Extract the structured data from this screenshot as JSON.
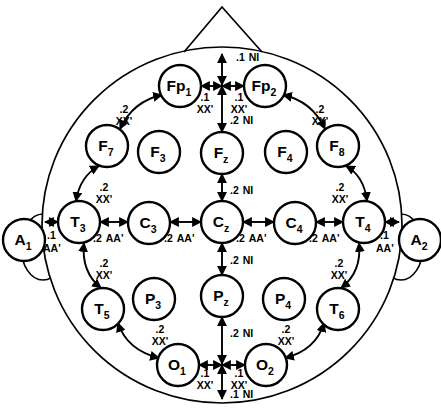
{
  "figure": {
    "head_outline": {
      "cx": 222,
      "cy": 225,
      "rx": 180,
      "ry": 178
    },
    "nose": {
      "apex_x": 222,
      "apex_y": 7,
      "left_x": 184,
      "left_y": 52,
      "right_x": 262,
      "right_y": 52
    },
    "ears": [
      {
        "name": "left-ear",
        "cx": 43,
        "cy": 247,
        "rx": 22,
        "ry": 33
      },
      {
        "name": "right-ear",
        "cx": 401,
        "cy": 247,
        "rx": 22,
        "ry": 33
      }
    ],
    "stroke": "#000000",
    "fill": "#ffffff"
  },
  "electrodes": [
    {
      "id": "Fp1",
      "base": "Fp",
      "sub": "1",
      "x": 180,
      "y": 86,
      "r": 21
    },
    {
      "id": "Fp2",
      "base": "Fp",
      "sub": "2",
      "x": 265,
      "y": 86,
      "r": 21
    },
    {
      "id": "F7",
      "base": "F",
      "sub": "7",
      "x": 107,
      "y": 146,
      "r": 21
    },
    {
      "id": "F3",
      "base": "F",
      "sub": "3",
      "x": 159,
      "y": 152,
      "r": 21
    },
    {
      "id": "Fz",
      "base": "F",
      "sub": "z",
      "x": 222,
      "y": 153,
      "r": 21
    },
    {
      "id": "F4",
      "base": "F",
      "sub": "4",
      "x": 286,
      "y": 152,
      "r": 21
    },
    {
      "id": "F8",
      "base": "F",
      "sub": "8",
      "x": 338,
      "y": 146,
      "r": 21
    },
    {
      "id": "A1",
      "base": "A",
      "sub": "1",
      "x": 24,
      "y": 240,
      "r": 21
    },
    {
      "id": "T3",
      "base": "T",
      "sub": "3",
      "x": 79,
      "y": 222,
      "r": 21
    },
    {
      "id": "C3",
      "base": "C",
      "sub": "3",
      "x": 149,
      "y": 223,
      "r": 21
    },
    {
      "id": "Cz",
      "base": "C",
      "sub": "z",
      "x": 222,
      "y": 222,
      "r": 21
    },
    {
      "id": "C4",
      "base": "C",
      "sub": "4",
      "x": 295,
      "y": 223,
      "r": 21
    },
    {
      "id": "T4",
      "base": "T",
      "sub": "4",
      "x": 364,
      "y": 222,
      "r": 21
    },
    {
      "id": "A2",
      "base": "A",
      "sub": "2",
      "x": 420,
      "y": 240,
      "r": 21
    },
    {
      "id": "T5",
      "base": "T",
      "sub": "5",
      "x": 103,
      "y": 309,
      "r": 21
    },
    {
      "id": "P3",
      "base": "P",
      "sub": "3",
      "x": 154,
      "y": 299,
      "r": 21
    },
    {
      "id": "Pz",
      "base": "P",
      "sub": "z",
      "x": 222,
      "y": 296,
      "r": 21
    },
    {
      "id": "P4",
      "base": "P",
      "sub": "4",
      "x": 284,
      "y": 299,
      "r": 21
    },
    {
      "id": "T6",
      "base": "T",
      "sub": "6",
      "x": 338,
      "y": 309,
      "r": 21
    },
    {
      "id": "O1",
      "base": "O",
      "sub": "1",
      "x": 178,
      "y": 365,
      "r": 21
    },
    {
      "id": "O2",
      "base": "O",
      "sub": "2",
      "x": 266,
      "y": 365,
      "r": 21
    }
  ],
  "measurements": [
    {
      "name": "nasion-to-Fp-midline",
      "frac": ".1",
      "ref": "NI",
      "lx": 236,
      "ly": 61,
      "anchor": "start"
    },
    {
      "name": "Fp1-to-midline",
      "frac": ".1",
      "ref": "XX'",
      "lx": 205,
      "ly": 101,
      "anchor": "middle"
    },
    {
      "name": "Fp2-to-midline",
      "frac": ".1",
      "ref": "XX'",
      "lx": 239,
      "ly": 101,
      "anchor": "middle"
    },
    {
      "name": "midline-Fp-to-Fz",
      "frac": ".2",
      "ref": "NI",
      "lx": 230,
      "ly": 124,
      "anchor": "start"
    },
    {
      "name": "Fp1-to-F7",
      "frac": ".2",
      "ref": "XX'",
      "lx": 124,
      "ly": 113,
      "anchor": "middle"
    },
    {
      "name": "Fp2-to-F8",
      "frac": ".2",
      "ref": "XX'",
      "lx": 320,
      "ly": 113,
      "anchor": "middle"
    },
    {
      "name": "F7-to-T3",
      "frac": ".2",
      "ref": "XX'",
      "lx": 104,
      "ly": 191,
      "anchor": "middle"
    },
    {
      "name": "F8-to-T4",
      "frac": ".2",
      "ref": "XX'",
      "lx": 340,
      "ly": 191,
      "anchor": "middle"
    },
    {
      "name": "Fz-to-Cz",
      "frac": ".2",
      "ref": "NI",
      "lx": 230,
      "ly": 194,
      "anchor": "start"
    },
    {
      "name": "A1-to-T3",
      "frac": ".1",
      "ref": "AA'",
      "lx": 47,
      "ly": 239,
      "anchor": "start"
    },
    {
      "name": "T3-to-C3",
      "frac": ".2",
      "ref": "AA'",
      "lx": 93,
      "ly": 242,
      "anchor": "start"
    },
    {
      "name": "C3-to-Cz",
      "frac": ".2",
      "ref": "AA'",
      "lx": 164,
      "ly": 242,
      "anchor": "start"
    },
    {
      "name": "Cz-to-C4",
      "frac": ".2",
      "ref": "AA'",
      "lx": 236,
      "ly": 242,
      "anchor": "start"
    },
    {
      "name": "C4-to-T4",
      "frac": ".2",
      "ref": "AA'",
      "lx": 309,
      "ly": 242,
      "anchor": "start"
    },
    {
      "name": "T4-to-A2",
      "frac": ".1",
      "ref": "AA'",
      "lx": 380,
      "ly": 239,
      "anchor": "start"
    },
    {
      "name": "T3-to-T5",
      "frac": ".2",
      "ref": "XX'",
      "lx": 104,
      "ly": 267,
      "anchor": "middle"
    },
    {
      "name": "T4-to-T6",
      "frac": ".2",
      "ref": "XX'",
      "lx": 339,
      "ly": 267,
      "anchor": "middle"
    },
    {
      "name": "Cz-to-Pz",
      "frac": ".2",
      "ref": "NI",
      "lx": 230,
      "ly": 264,
      "anchor": "start"
    },
    {
      "name": "T5-to-O1",
      "frac": ".2",
      "ref": "XX'",
      "lx": 160,
      "ly": 333,
      "anchor": "middle"
    },
    {
      "name": "T6-to-O2",
      "frac": ".2",
      "ref": "XX'",
      "lx": 286,
      "ly": 333,
      "anchor": "middle"
    },
    {
      "name": "Pz-to-inion-midline",
      "frac": ".2",
      "ref": "NI",
      "lx": 230,
      "ly": 337,
      "anchor": "start"
    },
    {
      "name": "O1-to-midline",
      "frac": ".1",
      "ref": "XX'",
      "lx": 205,
      "ly": 377,
      "anchor": "middle"
    },
    {
      "name": "O2-to-midline",
      "frac": ".1",
      "ref": "XX'",
      "lx": 239,
      "ly": 377,
      "anchor": "middle"
    },
    {
      "name": "midline-O-to-inion",
      "frac": ".1",
      "ref": "NI",
      "lx": 230,
      "ly": 398,
      "anchor": "start"
    }
  ],
  "connectors": {
    "straight": [
      {
        "name": "arrow-nasion-to-Fp-midline",
        "x1": 222,
        "y1": 54,
        "x2": 222,
        "y2": 85,
        "both": true
      },
      {
        "name": "arrow-Fp1-to-Fpmid",
        "x1": 222,
        "y1": 86,
        "x2": 201,
        "y2": 86,
        "both": true
      },
      {
        "name": "arrow-Fpmid-to-Fp2",
        "x1": 222,
        "y1": 86,
        "x2": 244,
        "y2": 86,
        "both": true
      },
      {
        "name": "arrow-Fpmid-to-Fz",
        "x1": 222,
        "y1": 86,
        "x2": 222,
        "y2": 132,
        "both": true
      },
      {
        "name": "arrow-Fz-to-Cz",
        "x1": 222,
        "y1": 174,
        "x2": 222,
        "y2": 201,
        "both": true
      },
      {
        "name": "arrow-A1-to-T3",
        "x1": 45,
        "y1": 222,
        "x2": 58,
        "y2": 222,
        "both": true
      },
      {
        "name": "arrow-T3-to-C3",
        "x1": 100,
        "y1": 222,
        "x2": 128,
        "y2": 222,
        "both": true
      },
      {
        "name": "arrow-C3-to-Cz",
        "x1": 170,
        "y1": 222,
        "x2": 201,
        "y2": 222,
        "both": true
      },
      {
        "name": "arrow-Cz-to-C4",
        "x1": 243,
        "y1": 222,
        "x2": 274,
        "y2": 222,
        "both": true
      },
      {
        "name": "arrow-C4-to-T4",
        "x1": 316,
        "y1": 222,
        "x2": 343,
        "y2": 222,
        "both": true
      },
      {
        "name": "arrow-T4-to-A2",
        "x1": 385,
        "y1": 222,
        "x2": 399,
        "y2": 222,
        "both": true
      },
      {
        "name": "arrow-Cz-to-Pz",
        "x1": 222,
        "y1": 243,
        "x2": 222,
        "y2": 275,
        "both": true
      },
      {
        "name": "arrow-Pz-to-Omid",
        "x1": 222,
        "y1": 317,
        "x2": 222,
        "y2": 364,
        "both": true
      },
      {
        "name": "arrow-O1-to-Omid",
        "x1": 222,
        "y1": 365,
        "x2": 199,
        "y2": 365,
        "both": true
      },
      {
        "name": "arrow-Omid-to-O2",
        "x1": 222,
        "y1": 365,
        "x2": 245,
        "y2": 365,
        "both": true
      },
      {
        "name": "arrow-Omid-to-inion",
        "x1": 222,
        "y1": 365,
        "x2": 222,
        "y2": 399,
        "both": true
      }
    ],
    "curved": [
      {
        "name": "arc-Fp1-to-F7",
        "x1": 162,
        "y1": 95,
        "x2": 120,
        "y2": 129,
        "cx": 133,
        "cy": 101
      },
      {
        "name": "arc-Fp2-to-F8",
        "x1": 283,
        "y1": 95,
        "x2": 325,
        "y2": 129,
        "cx": 312,
        "cy": 101
      },
      {
        "name": "arc-F7-to-T3",
        "x1": 99,
        "y1": 166,
        "x2": 76,
        "y2": 201,
        "cx": 80,
        "cy": 176
      },
      {
        "name": "arc-F8-to-T4",
        "x1": 346,
        "y1": 166,
        "x2": 367,
        "y2": 201,
        "cx": 364,
        "cy": 176
      },
      {
        "name": "arc-T3-to-T5",
        "x1": 84,
        "y1": 243,
        "x2": 101,
        "y2": 288,
        "cx": 81,
        "cy": 272
      },
      {
        "name": "arc-T4-to-T6",
        "x1": 359,
        "y1": 243,
        "x2": 341,
        "y2": 288,
        "cx": 362,
        "cy": 272
      },
      {
        "name": "arc-T5-to-O1",
        "x1": 118,
        "y1": 323,
        "x2": 159,
        "y2": 358,
        "cx": 127,
        "cy": 350
      },
      {
        "name": "arc-T6-to-O2",
        "x1": 324,
        "y1": 323,
        "x2": 285,
        "y2": 358,
        "cx": 316,
        "cy": 350
      }
    ]
  }
}
